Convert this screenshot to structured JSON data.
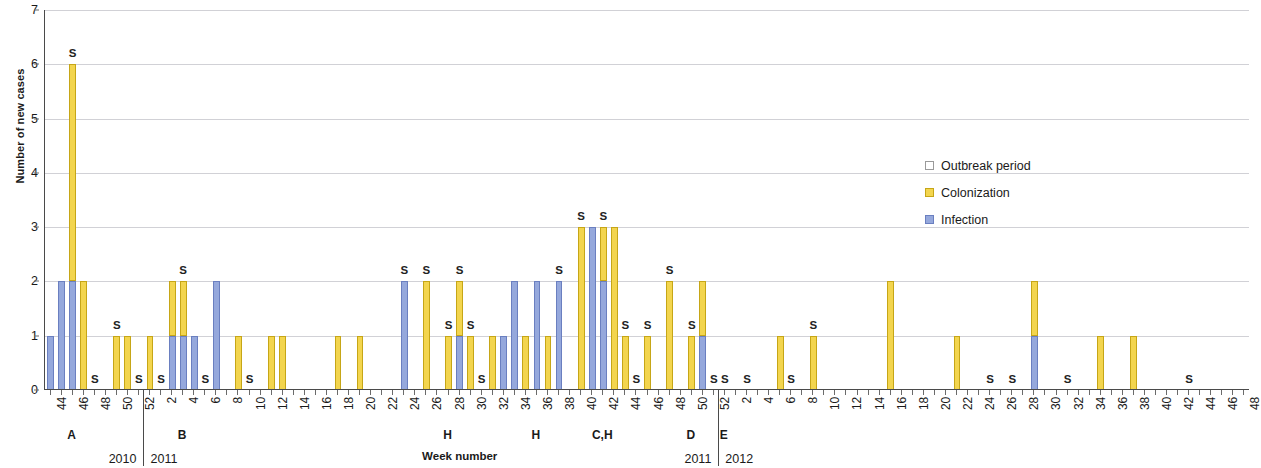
{
  "chart_data": {
    "type": "bar",
    "title": "",
    "xlabel": "Week number",
    "ylabel": "Number of new cases",
    "ylim": [
      0,
      7
    ],
    "y_ticks": [
      0,
      1,
      2,
      3,
      4,
      5,
      6,
      7
    ],
    "grid": true,
    "stacked": true,
    "legend_position": "right",
    "legend": [
      "Outbreak period",
      "Colonization",
      "Infection"
    ],
    "series": [
      {
        "name": "Infection",
        "color": "#95a8dc"
      },
      {
        "name": "Colonization",
        "color": "#f3d54e"
      }
    ],
    "x_axis_note": "Week numbers labelled every 2 weeks; one bar slot per week",
    "points": [
      {
        "year": 2010,
        "week": 44,
        "infection": 1,
        "colonization": 0,
        "s": false
      },
      {
        "year": 2010,
        "week": 45,
        "infection": 2,
        "colonization": 0,
        "s": false
      },
      {
        "year": 2010,
        "week": 46,
        "infection": 2,
        "colonization": 4,
        "s": true
      },
      {
        "year": 2010,
        "week": 47,
        "infection": 0,
        "colonization": 2,
        "s": false
      },
      {
        "year": 2010,
        "week": 48,
        "infection": 0,
        "colonization": 0,
        "s": true
      },
      {
        "year": 2010,
        "week": 50,
        "infection": 0,
        "colonization": 1,
        "s": true
      },
      {
        "year": 2010,
        "week": 51,
        "infection": 0,
        "colonization": 1,
        "s": false
      },
      {
        "year": 2010,
        "week": 52,
        "infection": 0,
        "colonization": 0,
        "s": true
      },
      {
        "year": 2011,
        "week": 1,
        "infection": 0,
        "colonization": 1,
        "s": false
      },
      {
        "year": 2011,
        "week": 2,
        "infection": 0,
        "colonization": 0,
        "s": true
      },
      {
        "year": 2011,
        "week": 3,
        "infection": 1,
        "colonization": 1,
        "s": false
      },
      {
        "year": 2011,
        "week": 4,
        "infection": 1,
        "colonization": 1,
        "s": true
      },
      {
        "year": 2011,
        "week": 5,
        "infection": 1,
        "colonization": 0,
        "s": false
      },
      {
        "year": 2011,
        "week": 6,
        "infection": 0,
        "colonization": 0,
        "s": true
      },
      {
        "year": 2011,
        "week": 7,
        "infection": 2,
        "colonization": 0,
        "s": false
      },
      {
        "year": 2011,
        "week": 9,
        "infection": 0,
        "colonization": 1,
        "s": false
      },
      {
        "year": 2011,
        "week": 10,
        "infection": 0,
        "colonization": 0,
        "s": true
      },
      {
        "year": 2011,
        "week": 12,
        "infection": 0,
        "colonization": 1,
        "s": false
      },
      {
        "year": 2011,
        "week": 13,
        "infection": 0,
        "colonization": 1,
        "s": false
      },
      {
        "year": 2011,
        "week": 18,
        "infection": 0,
        "colonization": 1,
        "s": false
      },
      {
        "year": 2011,
        "week": 20,
        "infection": 0,
        "colonization": 1,
        "s": false
      },
      {
        "year": 2011,
        "week": 24,
        "infection": 2,
        "colonization": 0,
        "s": true
      },
      {
        "year": 2011,
        "week": 26,
        "infection": 0,
        "colonization": 2,
        "s": true
      },
      {
        "year": 2011,
        "week": 28,
        "infection": 0,
        "colonization": 1,
        "s": true
      },
      {
        "year": 2011,
        "week": 29,
        "infection": 1,
        "colonization": 1,
        "s": true
      },
      {
        "year": 2011,
        "week": 30,
        "infection": 0,
        "colonization": 1,
        "s": true
      },
      {
        "year": 2011,
        "week": 31,
        "infection": 0,
        "colonization": 0,
        "s": true
      },
      {
        "year": 2011,
        "week": 32,
        "infection": 0,
        "colonization": 1,
        "s": false
      },
      {
        "year": 2011,
        "week": 33,
        "infection": 1,
        "colonization": 0,
        "s": false
      },
      {
        "year": 2011,
        "week": 34,
        "infection": 2,
        "colonization": 0,
        "s": false
      },
      {
        "year": 2011,
        "week": 35,
        "infection": 0,
        "colonization": 1,
        "s": false
      },
      {
        "year": 2011,
        "week": 36,
        "infection": 2,
        "colonization": 0,
        "s": false
      },
      {
        "year": 2011,
        "week": 37,
        "infection": 0,
        "colonization": 1,
        "s": false
      },
      {
        "year": 2011,
        "week": 38,
        "infection": 2,
        "colonization": 0,
        "s": true
      },
      {
        "year": 2011,
        "week": 40,
        "infection": 0,
        "colonization": 3,
        "s": true
      },
      {
        "year": 2011,
        "week": 41,
        "infection": 3,
        "colonization": 0,
        "s": false
      },
      {
        "year": 2011,
        "week": 42,
        "infection": 2,
        "colonization": 1,
        "s": true
      },
      {
        "year": 2011,
        "week": 43,
        "infection": 0,
        "colonization": 3,
        "s": false
      },
      {
        "year": 2011,
        "week": 44,
        "infection": 0,
        "colonization": 1,
        "s": true
      },
      {
        "year": 2011,
        "week": 45,
        "infection": 0,
        "colonization": 0,
        "s": true
      },
      {
        "year": 2011,
        "week": 46,
        "infection": 0,
        "colonization": 1,
        "s": true
      },
      {
        "year": 2011,
        "week": 48,
        "infection": 0,
        "colonization": 2,
        "s": true
      },
      {
        "year": 2011,
        "week": 50,
        "infection": 0,
        "colonization": 1,
        "s": true
      },
      {
        "year": 2011,
        "week": 51,
        "infection": 1,
        "colonization": 1,
        "s": false
      },
      {
        "year": 2011,
        "week": 52,
        "infection": 0,
        "colonization": 0,
        "s": true
      },
      {
        "year": 2012,
        "week": 1,
        "infection": 0,
        "colonization": 0,
        "s": true
      },
      {
        "year": 2012,
        "week": 3,
        "infection": 0,
        "colonization": 0,
        "s": true
      },
      {
        "year": 2012,
        "week": 6,
        "infection": 0,
        "colonization": 1,
        "s": false
      },
      {
        "year": 2012,
        "week": 7,
        "infection": 0,
        "colonization": 0,
        "s": true
      },
      {
        "year": 2012,
        "week": 9,
        "infection": 0,
        "colonization": 1,
        "s": true
      },
      {
        "year": 2012,
        "week": 16,
        "infection": 0,
        "colonization": 2,
        "s": false
      },
      {
        "year": 2012,
        "week": 22,
        "infection": 0,
        "colonization": 1,
        "s": false
      },
      {
        "year": 2012,
        "week": 25,
        "infection": 0,
        "colonization": 0,
        "s": true
      },
      {
        "year": 2012,
        "week": 27,
        "infection": 0,
        "colonization": 0,
        "s": true
      },
      {
        "year": 2012,
        "week": 29,
        "infection": 1,
        "colonization": 1,
        "s": false
      },
      {
        "year": 2012,
        "week": 32,
        "infection": 0,
        "colonization": 0,
        "s": true
      },
      {
        "year": 2012,
        "week": 35,
        "infection": 0,
        "colonization": 1,
        "s": false
      },
      {
        "year": 2012,
        "week": 38,
        "infection": 0,
        "colonization": 1,
        "s": false
      },
      {
        "year": 2012,
        "week": 43,
        "infection": 0,
        "colonization": 0,
        "s": true
      }
    ],
    "outbreak_markers": [
      {
        "label": "A",
        "year": 2010,
        "week": 46
      },
      {
        "label": "B",
        "year": 2011,
        "week": 4
      },
      {
        "label": "H",
        "year": 2011,
        "week": 28
      },
      {
        "label": "H",
        "year": 2011,
        "week": 36
      },
      {
        "label": "C,H",
        "year": 2011,
        "week": 42
      },
      {
        "label": "D",
        "year": 2011,
        "week": 50
      },
      {
        "label": "E",
        "year": 2012,
        "week": 1
      }
    ],
    "year_dividers": [
      {
        "left_label": "2010",
        "right_label": "2011",
        "after_year": 2010,
        "after_week": 52
      },
      {
        "left_label": "2011",
        "right_label": "2012",
        "after_year": 2011,
        "after_week": 52
      }
    ],
    "s_marker_meaning": "S"
  },
  "legend": {
    "items": [
      {
        "key": "outbreak",
        "label": "Outbreak period",
        "color": "#ffffff"
      },
      {
        "key": "colonization",
        "label": "Colonization",
        "color": "#f3d54e"
      },
      {
        "key": "infection",
        "label": "Infection",
        "color": "#95a8dc"
      }
    ]
  },
  "axes": {
    "y_title": "Number of new cases",
    "x_title": "Week number",
    "y_tick_labels": [
      "0",
      "1",
      "2",
      "3",
      "4",
      "5",
      "6",
      "7"
    ],
    "x_tick_labels_2010": [
      "44",
      "46",
      "48",
      "50",
      "52"
    ],
    "x_tick_labels_2011": [
      "2",
      "4",
      "6",
      "8",
      "10",
      "12",
      "14",
      "16",
      "18",
      "20",
      "22",
      "24",
      "26",
      "28",
      "30",
      "32",
      "34",
      "36",
      "38",
      "40",
      "42",
      "44",
      "46",
      "48",
      "50",
      "52"
    ],
    "x_tick_labels_2012": [
      "2",
      "4",
      "6",
      "8",
      "10",
      "12",
      "14",
      "16",
      "18",
      "20",
      "22",
      "24",
      "26",
      "28",
      "30",
      "32",
      "34",
      "36",
      "38",
      "40",
      "42",
      "44",
      "46",
      "48"
    ]
  }
}
